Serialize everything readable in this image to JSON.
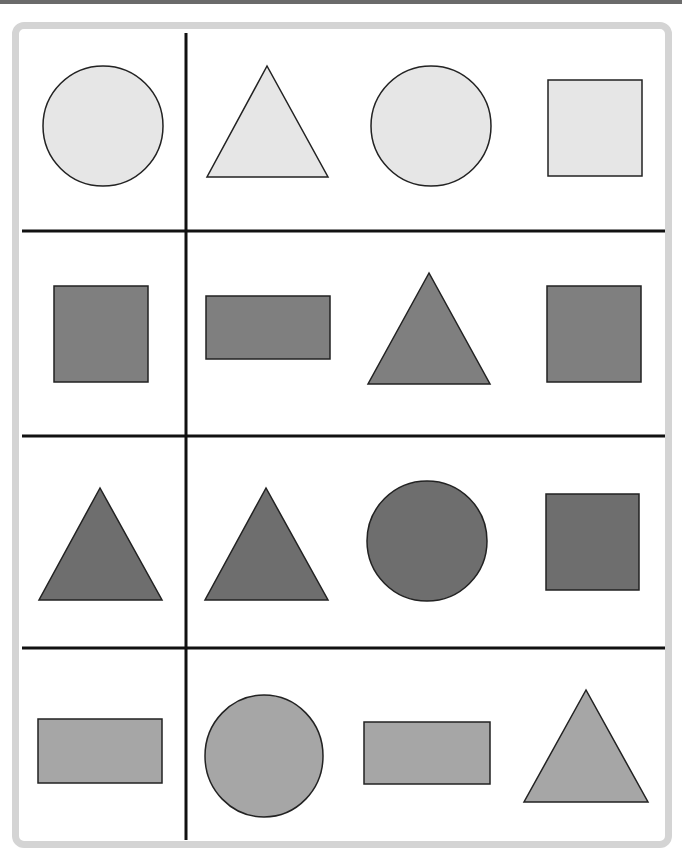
{
  "page": {
    "title": "",
    "colors": {
      "header_bar": "#6b6b6b",
      "card_border": "#d4d4d4",
      "grid_line": "#111111",
      "shape_stroke": "#222222"
    }
  },
  "worksheet": {
    "rows": [
      {
        "fill": "#e6e6e6",
        "shapes": [
          {
            "type": "circle",
            "label": "circle"
          },
          {
            "type": "triangle",
            "label": "triangle"
          },
          {
            "type": "circle",
            "label": "circle"
          },
          {
            "type": "square",
            "label": "square"
          }
        ]
      },
      {
        "fill": "#7f7f7f",
        "shapes": [
          {
            "type": "square",
            "label": "square"
          },
          {
            "type": "rectangle",
            "label": "rectangle"
          },
          {
            "type": "triangle",
            "label": "triangle"
          },
          {
            "type": "square",
            "label": "square"
          }
        ]
      },
      {
        "fill": "#6e6e6e",
        "shapes": [
          {
            "type": "triangle",
            "label": "triangle"
          },
          {
            "type": "triangle",
            "label": "triangle"
          },
          {
            "type": "circle",
            "label": "circle"
          },
          {
            "type": "square",
            "label": "square"
          }
        ]
      },
      {
        "fill": "#a6a6a6",
        "shapes": [
          {
            "type": "rectangle",
            "label": "rectangle"
          },
          {
            "type": "circle",
            "label": "oval"
          },
          {
            "type": "rectangle",
            "label": "rectangle"
          },
          {
            "type": "triangle",
            "label": "triangle"
          }
        ]
      }
    ]
  }
}
